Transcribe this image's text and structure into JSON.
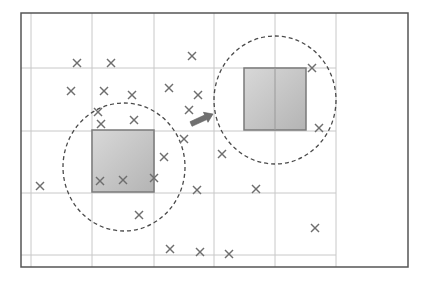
{
  "diagram": {
    "frame": {
      "x": 21,
      "y": 13,
      "width": 387,
      "height": 254,
      "stroke": "#555555"
    },
    "grid": {
      "vertical": [
        31,
        92,
        154,
        214,
        275,
        336
      ],
      "horizontal": [
        68,
        131,
        193,
        255
      ],
      "x_extent": [
        21,
        336
      ],
      "y_extent": [
        13,
        267
      ],
      "stroke": "#c8c8c8"
    },
    "regions": [
      {
        "name": "before",
        "square": {
          "x": 92,
          "y": 130,
          "size": 62
        },
        "circle": {
          "cx": 124,
          "cy": 167,
          "rx": 61,
          "ry": 64
        }
      },
      {
        "name": "after",
        "square": {
          "x": 244,
          "y": 68,
          "size": 62
        },
        "circle": {
          "cx": 275,
          "cy": 100,
          "rx": 61,
          "ry": 64
        }
      }
    ],
    "arrow": {
      "x1": 191,
      "y1": 124,
      "x2": 213,
      "y2": 114,
      "color": "#707070"
    },
    "points": [
      [
        77,
        63
      ],
      [
        111,
        63
      ],
      [
        192,
        56
      ],
      [
        71,
        91
      ],
      [
        104,
        91
      ],
      [
        132,
        95
      ],
      [
        169,
        88
      ],
      [
        198,
        95
      ],
      [
        98,
        112
      ],
      [
        189,
        110
      ],
      [
        101,
        124
      ],
      [
        134,
        120
      ],
      [
        184,
        139
      ],
      [
        164,
        157
      ],
      [
        154,
        178
      ],
      [
        100,
        181
      ],
      [
        123,
        180
      ],
      [
        40,
        186
      ],
      [
        197,
        190
      ],
      [
        256,
        189
      ],
      [
        139,
        215
      ],
      [
        170,
        249
      ],
      [
        200,
        252
      ],
      [
        229,
        254
      ],
      [
        312,
        68
      ],
      [
        319,
        128
      ],
      [
        222,
        154
      ],
      [
        315,
        228
      ]
    ],
    "colors": {
      "square_fill_light": "#d8d8d8",
      "square_fill_dark": "#b4b4b4",
      "square_stroke": "#7a7a7a",
      "circle_stroke": "#4a4a4a",
      "cross": "#6e6e6e"
    }
  }
}
